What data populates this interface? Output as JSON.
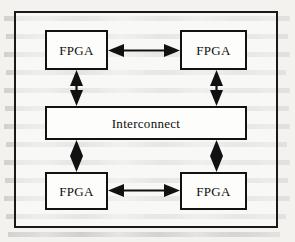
{
  "figure": {
    "type": "block-diagram",
    "caption_visible": false,
    "background_note": "scanned page with faint show-through text",
    "frame": {
      "name": "outer-frame",
      "stroke_color": "#1a1a1a"
    },
    "nodes": [
      {
        "id": "fpga-top-left",
        "label": "FPGA",
        "shape": "rectangle",
        "row": "top",
        "column": "left"
      },
      {
        "id": "fpga-top-right",
        "label": "FPGA",
        "shape": "rectangle",
        "row": "top",
        "column": "right"
      },
      {
        "id": "interconnect",
        "label": "Interconnect",
        "shape": "rectangle",
        "row": "middle",
        "column": "span"
      },
      {
        "id": "fpga-bottom-left",
        "label": "FPGA",
        "shape": "rectangle",
        "row": "bottom",
        "column": "left"
      },
      {
        "id": "fpga-bottom-right",
        "label": "FPGA",
        "shape": "rectangle",
        "row": "bottom",
        "column": "right"
      }
    ],
    "connections": [
      {
        "id": "conn-top-horizontal",
        "from": "fpga-top-left",
        "to": "fpga-top-right",
        "direction": "bidirectional",
        "orientation": "horizontal"
      },
      {
        "id": "conn-bottom-horizontal",
        "from": "fpga-bottom-left",
        "to": "fpga-bottom-right",
        "direction": "bidirectional",
        "orientation": "horizontal"
      },
      {
        "id": "conn-top-left-bus",
        "from": "fpga-top-left",
        "to": "interconnect",
        "direction": "bidirectional",
        "orientation": "vertical"
      },
      {
        "id": "conn-top-right-bus",
        "from": "fpga-top-right",
        "to": "interconnect",
        "direction": "bidirectional",
        "orientation": "vertical"
      },
      {
        "id": "conn-bottom-left-bus",
        "from": "interconnect",
        "to": "fpga-bottom-left",
        "direction": "bidirectional",
        "orientation": "vertical"
      },
      {
        "id": "conn-bottom-right-bus",
        "from": "interconnect",
        "to": "fpga-bottom-right",
        "direction": "bidirectional",
        "orientation": "vertical"
      }
    ],
    "colors": {
      "stroke": "#111111",
      "box_fill": "#fdfdfc",
      "page_background": "#f3f2ef"
    }
  }
}
